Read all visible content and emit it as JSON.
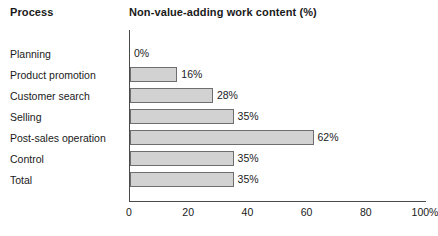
{
  "header": {
    "process_label": "Process",
    "chart_title": "Non-value-adding work content (%)"
  },
  "chart_data": {
    "type": "bar",
    "orientation": "horizontal",
    "title": "Non-value-adding work content (%)",
    "xlabel": "",
    "ylabel": "Process",
    "categories": [
      "Planning",
      "Product promotion",
      "Customer search",
      "Selling",
      "Post-sales operation",
      "Control",
      "Total"
    ],
    "values": [
      0,
      16,
      28,
      35,
      62,
      35,
      35
    ],
    "value_labels": [
      "0%",
      "16%",
      "28%",
      "35%",
      "62%",
      "35%",
      "35%"
    ],
    "xlim": [
      0,
      100
    ],
    "xticks": [
      0,
      20,
      40,
      60,
      80,
      100
    ],
    "xtick_labels": [
      "0",
      "20",
      "40",
      "60",
      "80",
      "100%"
    ],
    "grid": false,
    "legend": null,
    "bar_fill_color": "#d2d2d2",
    "bar_border_color": "#6e6e6e",
    "axis_color": "#4a4a4a"
  }
}
